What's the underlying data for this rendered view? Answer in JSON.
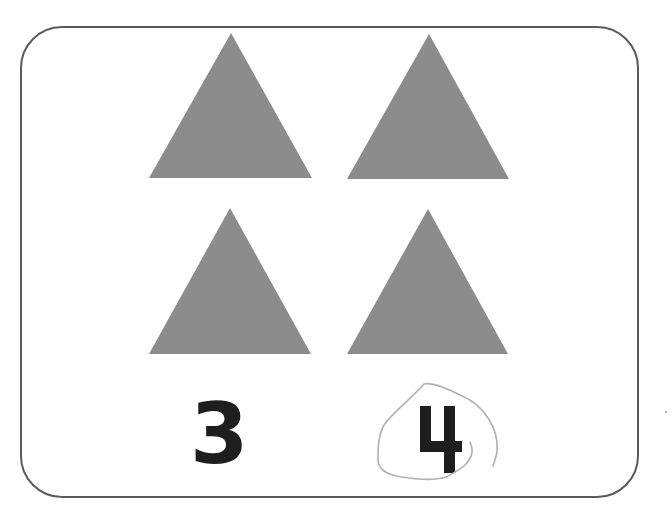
{
  "card": {
    "shape_color": "#8c8c8c",
    "border_color": "#5a5a5a",
    "shapes": [
      {
        "type": "triangle",
        "position": "top-left"
      },
      {
        "type": "triangle",
        "position": "top-right"
      },
      {
        "type": "triangle",
        "position": "bottom-left"
      },
      {
        "type": "triangle",
        "position": "bottom-right"
      }
    ],
    "answer_options": [
      {
        "label": "3",
        "circled": false
      },
      {
        "label": "4",
        "circled": true
      }
    ]
  }
}
